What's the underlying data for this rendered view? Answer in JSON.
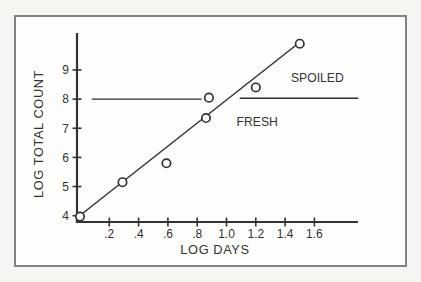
{
  "figure": {
    "background_color": "#f6f5f2",
    "paper_color": "#fdfdfb",
    "frame_border_color": "#828282",
    "ink_color": "#333333"
  },
  "chart_data": {
    "type": "scatter",
    "title": "",
    "xlabel": "LOG DAYS",
    "ylabel": "LOG TOTAL COUNT",
    "xlim": [
      -0.02,
      1.92
    ],
    "ylim": [
      3.8,
      10.3
    ],
    "grid": false,
    "legend": "none",
    "x_ticks": [
      {
        "value": 0.2,
        "label": ".2"
      },
      {
        "value": 0.4,
        "label": ".4"
      },
      {
        "value": 0.6,
        "label": ".6"
      },
      {
        "value": 0.8,
        "label": ".8"
      },
      {
        "value": 1.0,
        "label": "1.0"
      },
      {
        "value": 1.2,
        "label": "1.2"
      },
      {
        "value": 1.4,
        "label": "1.4"
      },
      {
        "value": 1.6,
        "label": "1.6"
      }
    ],
    "y_ticks": [
      {
        "value": 4,
        "label": "4"
      },
      {
        "value": 5,
        "label": "5"
      },
      {
        "value": 6,
        "label": "6"
      },
      {
        "value": 7,
        "label": "7"
      },
      {
        "value": 8,
        "label": "8"
      },
      {
        "value": 9,
        "label": "9"
      }
    ],
    "points": [
      {
        "x": 0.0,
        "y": 3.97
      },
      {
        "x": 0.29,
        "y": 5.15
      },
      {
        "x": 0.59,
        "y": 5.8
      },
      {
        "x": 0.86,
        "y": 7.35
      },
      {
        "x": 0.88,
        "y": 8.05
      },
      {
        "x": 1.2,
        "y": 8.4
      },
      {
        "x": 1.5,
        "y": 9.9
      }
    ],
    "trend_line": {
      "x1": -0.02,
      "y1": 3.93,
      "x2": 1.5,
      "y2": 9.95
    },
    "threshold": {
      "value": 8.0,
      "segments": [
        {
          "x1": 0.08,
          "x2": 0.83,
          "y": 8.0
        },
        {
          "x1": 1.09,
          "x2": 1.9,
          "y": 8.03
        }
      ]
    },
    "annotations": [
      {
        "text": "SPOILED",
        "x": 1.62,
        "y": 8.6
      },
      {
        "text": "FRESH",
        "x": 1.21,
        "y": 7.09
      }
    ]
  }
}
